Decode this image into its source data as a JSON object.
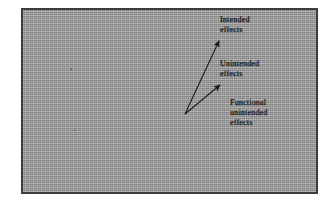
{
  "figure": {
    "panel": {
      "background_color": "#9c9c9c",
      "border_color": "#3d3d3d"
    },
    "origin_label": "",
    "labels": [
      {
        "id": "intended",
        "name": "intended-effects-label",
        "text": "Intended\neffects"
      },
      {
        "id": "unintended",
        "name": "unintended-effects-label",
        "text": "Unintended\neffects"
      },
      {
        "id": "functional",
        "name": "functional-unintended-effects-label",
        "text": "Functional\nunintended\neffects"
      }
    ],
    "arrows": [
      {
        "id": "arrow-to-intended",
        "name": "arrow-intended-effects",
        "from": [
          162,
          104
        ],
        "to": [
          196,
          30
        ],
        "color": "#1b1b1b"
      },
      {
        "id": "arrow-to-unintended",
        "name": "arrow-unintended-effects",
        "from": [
          162,
          104
        ],
        "to": [
          197,
          74
        ],
        "color": "#1b1b1b"
      }
    ]
  }
}
